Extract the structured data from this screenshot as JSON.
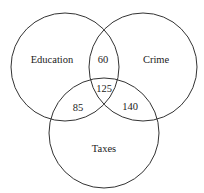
{
  "diagram": {
    "type": "venn",
    "sets": [
      {
        "id": "education",
        "label": "Education",
        "cx": 65,
        "cy": 67,
        "r": 54,
        "label_x": 52,
        "label_y": 59
      },
      {
        "id": "crime",
        "label": "Crime",
        "cx": 143,
        "cy": 67,
        "r": 54,
        "label_x": 156,
        "label_y": 59
      },
      {
        "id": "taxes",
        "label": "Taxes",
        "cx": 104,
        "cy": 133,
        "r": 55,
        "label_x": 104,
        "label_y": 148
      }
    ],
    "intersections": [
      {
        "sets": [
          "education",
          "crime"
        ],
        "value": "60",
        "x": 103,
        "y": 59
      },
      {
        "sets": [
          "education",
          "crime",
          "taxes"
        ],
        "value": "125",
        "x": 104,
        "y": 88
      },
      {
        "sets": [
          "education",
          "taxes"
        ],
        "value": "85",
        "x": 78,
        "y": 107
      },
      {
        "sets": [
          "crime",
          "taxes"
        ],
        "value": "140",
        "x": 130,
        "y": 106
      }
    ],
    "stroke_color": "#333333",
    "text_color": "#222222"
  }
}
